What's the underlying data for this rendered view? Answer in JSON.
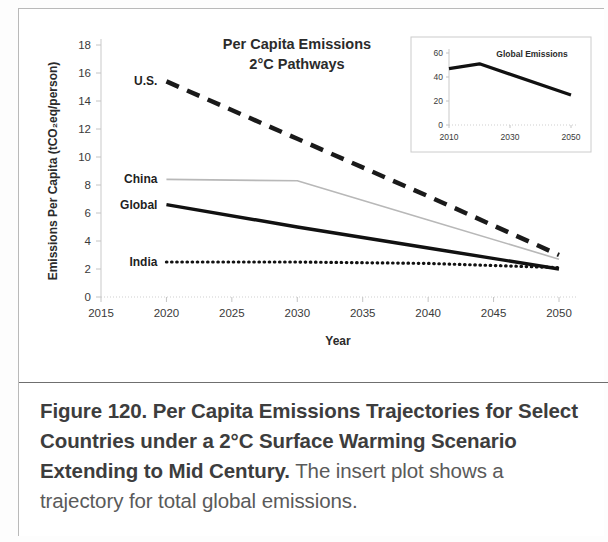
{
  "figure": {
    "caption_bold": "Figure 120. Per Capita Emissions Trajectories for Select Countries under a 2°C Surface Warming Scenario Extending to Mid Century.",
    "caption_rest": " The insert plot shows a trajectory for total global emissions."
  },
  "chart_data": {
    "type": "line",
    "title": "Per Capita Emissions",
    "subtitle": "2°C Pathways",
    "xlabel": "Year",
    "ylabel": "Emissions Per Capita (tCO₂eq/person)",
    "xlim": [
      2015,
      2050
    ],
    "ylim": [
      0,
      18
    ],
    "xticks": [
      2015,
      2020,
      2025,
      2030,
      2035,
      2040,
      2045,
      2050
    ],
    "yticks": [
      0,
      2,
      4,
      6,
      8,
      10,
      12,
      14,
      16,
      18
    ],
    "grid": false,
    "legend": "inline-labels",
    "series": [
      {
        "name": "U.S.",
        "style": "dashed",
        "color": "#1a1a1a",
        "width": 4.5,
        "x": [
          2020,
          2030,
          2040,
          2050
        ],
        "values": [
          15.4,
          11.3,
          7.2,
          3.0
        ]
      },
      {
        "name": "China",
        "style": "solid",
        "color": "#b8b8b8",
        "width": 1.6,
        "x": [
          2020,
          2030,
          2040,
          2050
        ],
        "values": [
          8.4,
          8.3,
          5.5,
          2.7
        ]
      },
      {
        "name": "Global",
        "style": "solid",
        "color": "#111111",
        "width": 3.4,
        "x": [
          2020,
          2030,
          2040,
          2050
        ],
        "values": [
          6.6,
          5.0,
          3.5,
          2.0
        ]
      },
      {
        "name": "India",
        "style": "dotted",
        "color": "#111111",
        "width": 3.2,
        "x": [
          2020,
          2030,
          2040,
          2050
        ],
        "values": [
          2.5,
          2.5,
          2.4,
          2.1
        ]
      }
    ],
    "inset": {
      "type": "line",
      "title": "Global Emissions",
      "xlim": [
        2010,
        2050
      ],
      "ylim": [
        0,
        60
      ],
      "xticks": [
        2010,
        2030,
        2050
      ],
      "yticks": [
        0,
        20,
        40,
        60
      ],
      "x": [
        2010,
        2020,
        2050
      ],
      "values": [
        47,
        51,
        25
      ],
      "color": "#111111",
      "width": 3.2
    }
  }
}
